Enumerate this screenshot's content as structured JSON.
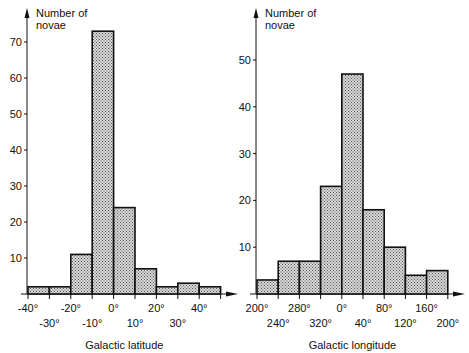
{
  "chart_data": [
    {
      "type": "bar",
      "title": "",
      "ylabel": "Number of novae",
      "xlabel": "Galactic latitude",
      "bin_edges": [
        -40,
        -30,
        -20,
        -10,
        0,
        10,
        20,
        30,
        40,
        50
      ],
      "categories": [
        "-40° to -30°",
        "-30° to -20°",
        "-20° to -10°",
        "-10° to 0°",
        "0° to 10°",
        "10° to 20°",
        "20° to 30°",
        "30° to 40°",
        "40° to 50°"
      ],
      "values": [
        2,
        2,
        11,
        73,
        24,
        7,
        2,
        3,
        2
      ],
      "xtick_labels_upper": [
        "-40°",
        "-20°",
        "0°",
        "20°",
        "40°"
      ],
      "xtick_labels_lower": [
        "-30°",
        "-10°",
        "10°",
        "30°"
      ],
      "yticks": [
        10,
        20,
        30,
        40,
        50,
        60,
        70
      ],
      "ylim": [
        0,
        75
      ],
      "grid": false
    },
    {
      "type": "bar",
      "title": "",
      "ylabel": "Number of novae",
      "xlabel": "Galactic longitude",
      "bin_edges": [
        200,
        240,
        280,
        320,
        0,
        40,
        80,
        120,
        160,
        200
      ],
      "categories": [
        "200°-240°",
        "240°-280°",
        "280°-320°",
        "320°-0°",
        "0°-40°",
        "40°-80°",
        "80°-120°",
        "120°-160°",
        "160°-200°"
      ],
      "values": [
        3,
        7,
        7,
        23,
        47,
        18,
        10,
        4,
        5
      ],
      "xtick_labels_upper": [
        "200°",
        "280°",
        "0°",
        "80°",
        "160°"
      ],
      "xtick_labels_lower": [
        "240°",
        "320°",
        "40°",
        "120°",
        "200°"
      ],
      "yticks": [
        10,
        20,
        30,
        40,
        50
      ],
      "ylim": [
        0,
        55
      ],
      "grid": false
    }
  ],
  "left": {
    "ylabel_line1": "Number of",
    "ylabel_line2": "novae",
    "xlabel": "Galactic latitude"
  },
  "right": {
    "ylabel_line1": "Number of",
    "ylabel_line2": "novae",
    "xlabel": "Galactic longitude"
  }
}
